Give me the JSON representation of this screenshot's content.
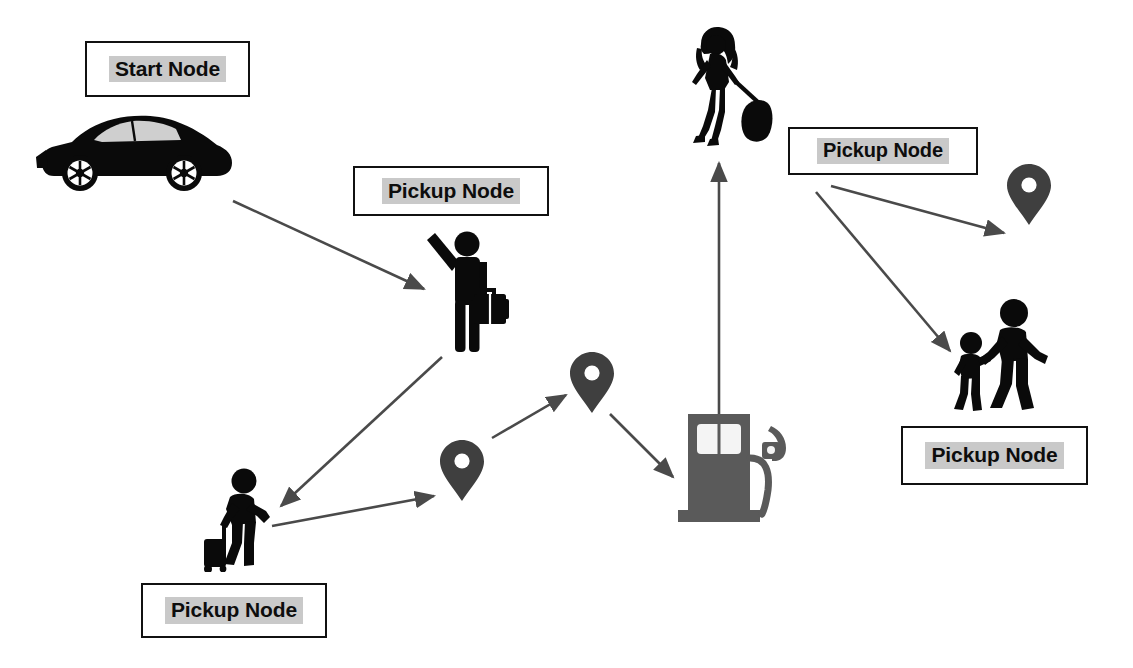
{
  "diagram": {
    "background_color": "#ffffff",
    "label_border_color": "#111111",
    "label_highlight_color": "#c9c9c9",
    "label_text_color": "#0d0d0d",
    "arrow_color": "#4a4a4a",
    "pin_color": "#3f3f3f",
    "figure_color": "#000000",
    "pump_color": "#5a5a5a",
    "labels": [
      {
        "id": "start-node",
        "text": "Start Node",
        "x": 85,
        "y": 41,
        "w": 165,
        "h": 56,
        "font_size": 21
      },
      {
        "id": "pickup-node-driver",
        "text": "Pickup Node",
        "x": 353,
        "y": 166,
        "w": 196,
        "h": 50,
        "font_size": 21
      },
      {
        "id": "pickup-node-woman",
        "text": "Pickup Node",
        "x": 788,
        "y": 127,
        "w": 190,
        "h": 48,
        "font_size": 20
      },
      {
        "id": "pickup-node-family",
        "text": "Pickup Node",
        "x": 901,
        "y": 426,
        "w": 187,
        "h": 59,
        "font_size": 21
      },
      {
        "id": "pickup-node-traveler",
        "text": "Pickup Node",
        "x": 141,
        "y": 583,
        "w": 186,
        "h": 55,
        "font_size": 21
      }
    ],
    "icons": [
      {
        "id": "car",
        "name": "car-icon",
        "label": "Start vehicle (sedan)",
        "x": 36,
        "y": 110,
        "w": 200,
        "h": 85
      },
      {
        "id": "hailing-passenger",
        "name": "person-hailing-with-briefcase-icon",
        "label": "Passenger hailing ride with briefcase",
        "x": 425,
        "y": 228,
        "w": 92,
        "h": 130
      },
      {
        "id": "woman-luggage",
        "name": "woman-with-rolling-luggage-icon",
        "label": "Woman walking with rolling luggage",
        "x": 683,
        "y": 26,
        "w": 90,
        "h": 128
      },
      {
        "id": "gas-pump",
        "name": "gas-pump-icon",
        "label": "Fuel station pump",
        "x": 676,
        "y": 410,
        "w": 120,
        "h": 115
      },
      {
        "id": "family",
        "name": "adult-with-child-icon",
        "label": "Adult walking with child",
        "x": 944,
        "y": 296,
        "w": 115,
        "h": 122
      },
      {
        "id": "traveler",
        "name": "traveler-with-suitcase-icon",
        "label": "Traveler pulling suitcase",
        "x": 196,
        "y": 467,
        "w": 90,
        "h": 105
      },
      {
        "id": "pin-lower-left",
        "name": "map-pin-icon",
        "label": "Map pin (lower left)",
        "x": 440,
        "y": 440,
        "w": 44,
        "h": 62
      },
      {
        "id": "pin-middle",
        "name": "map-pin-icon",
        "label": "Map pin (middle)",
        "x": 570,
        "y": 352,
        "w": 44,
        "h": 62
      },
      {
        "id": "pin-right",
        "name": "map-pin-icon",
        "label": "Map pin (right)",
        "x": 1007,
        "y": 164,
        "w": 44,
        "h": 62
      }
    ],
    "arrows": [
      {
        "id": "car-to-hailing",
        "from": "car",
        "to": "hailing-passenger",
        "x1": 233,
        "y1": 201,
        "x2": 424,
        "y2": 289
      },
      {
        "id": "hailing-to-traveler",
        "from": "hailing-passenger",
        "to": "traveler",
        "x1": 442,
        "y1": 357,
        "x2": 281,
        "y2": 506
      },
      {
        "id": "traveler-to-pin-lower-left",
        "from": "traveler",
        "to": "pin-lower-left",
        "x1": 272,
        "y1": 526,
        "x2": 434,
        "y2": 496
      },
      {
        "id": "pin-lower-left-to-pin-middle",
        "from": "pin-lower-left",
        "to": "pin-middle",
        "x1": 492,
        "y1": 438,
        "x2": 566,
        "y2": 395
      },
      {
        "id": "pin-middle-to-pump",
        "from": "pin-middle",
        "to": "gas-pump",
        "x1": 610,
        "y1": 414,
        "x2": 673,
        "y2": 477
      },
      {
        "id": "pump-to-woman",
        "from": "gas-pump",
        "to": "woman-luggage",
        "x1": 719,
        "y1": 512,
        "x2": 719,
        "y2": 163
      },
      {
        "id": "woman-label-to-pin-right",
        "from": "pickup-node-woman",
        "to": "pin-right",
        "x1": 831,
        "y1": 186,
        "x2": 1004,
        "y2": 233
      },
      {
        "id": "woman-label-to-family",
        "from": "pickup-node-woman",
        "to": "family",
        "x1": 816,
        "y1": 192,
        "x2": 950,
        "y2": 351
      }
    ]
  }
}
